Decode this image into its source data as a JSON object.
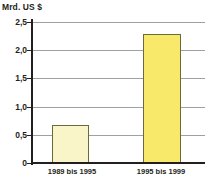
{
  "chart_data": {
    "type": "bar",
    "title": "",
    "ylabel": "Mrd. US $",
    "xlabel": "",
    "categories": [
      "1989 bis 1995",
      "1995 bis 1999"
    ],
    "values": [
      0.68,
      2.28
    ],
    "ylim": [
      0,
      2.5
    ],
    "ytick_labels": [
      "0",
      "0,5",
      "1,0",
      "1,5",
      "2,0",
      "2,5"
    ],
    "ytick_values": [
      0,
      0.5,
      1.0,
      1.5,
      2.0,
      2.5
    ],
    "grid": true,
    "legend": "none",
    "bar_colors": [
      "#faf5c8",
      "#f8e96b"
    ],
    "bar_border_color": "#6d6a3a",
    "gridline_color": "#9d9fa2",
    "axis_color": "#231f20",
    "background_color": "#ffffff"
  },
  "axis": {
    "unit_caption": "Mrd. US $"
  }
}
